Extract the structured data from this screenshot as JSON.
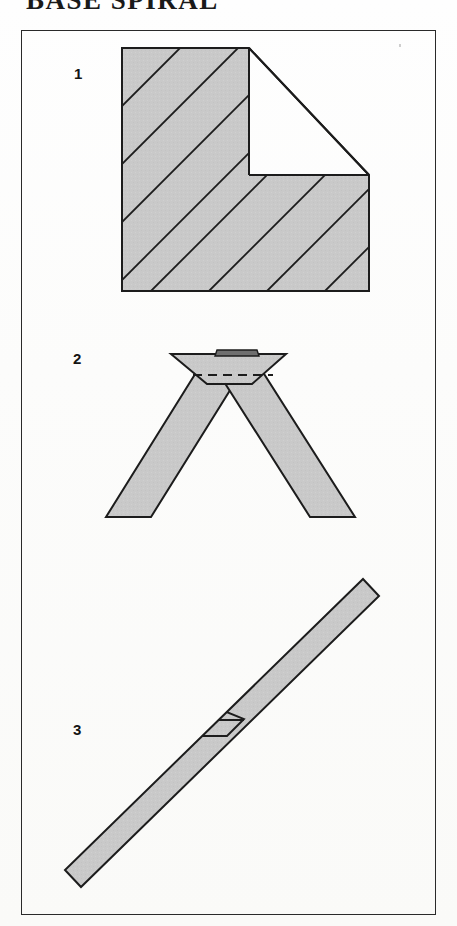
{
  "document": {
    "title": "BASE SPIRAL",
    "title_visible_fragment": "BASE SPIRAL",
    "kind": "paper-folding-instruction-diagram"
  },
  "frame": {
    "border_color": "#2a2a2a",
    "background": "#ffffff"
  },
  "palette": {
    "paper_fill": "#c9c9c9",
    "paper_fill_light": "#cfcfcf",
    "outline": "#1c1c1c",
    "tab_fill": "#6f6f6f",
    "fold_line": "#1c1c1c",
    "page_background": "#fdfdfc"
  },
  "steps": [
    {
      "number": "1",
      "name": "step-1",
      "description": "Square sheet with a stepped notch cut from the upper-right corner and parallel diagonal score lines",
      "shape": "notched-square-with-diagonal-hatching",
      "hatch_line_count": 9,
      "hatch_angle_degrees": 45
    },
    {
      "number": "2",
      "name": "step-2",
      "description": "Two strips crossed into a V / chevron, joined at the apex with a small dark tab and a dashed fold line",
      "shape": "chevron-of-two-crossed-strips",
      "has_dashed_fold_line": true,
      "has_tab": true
    },
    {
      "number": "3",
      "name": "step-3",
      "description": "Single long diagonal strip with a hexagonal interlock marking at its centre",
      "shape": "diagonal-strip-with-hexagonal-lock",
      "has_hexagon_marking": true
    }
  ]
}
